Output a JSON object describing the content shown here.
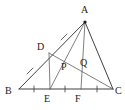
{
  "figure": {
    "kind": "euclidean-geometry-diagram",
    "canvas": {
      "width": 125,
      "height": 110
    },
    "stroke_color": "#2b2b2b",
    "thin_stroke_color": "#555555",
    "background_color": "#ffffff",
    "label_color": "#1c1c1c"
  },
  "points": {
    "A": {
      "label": "A",
      "x": 85,
      "y": 22,
      "label_x": 81,
      "label_y": 5,
      "marked_dot": true
    },
    "B": {
      "label": "B",
      "x": 19,
      "y": 89,
      "label_x": 5,
      "label_y": 86,
      "marked_dot": false
    },
    "C": {
      "label": "C",
      "x": 113,
      "y": 89,
      "label_x": 115,
      "label_y": 86,
      "marked_dot": false
    },
    "D": {
      "label": "D",
      "x": 49,
      "y": 53,
      "label_x": 37,
      "label_y": 42,
      "marked_dot": false
    },
    "E": {
      "label": "E",
      "x": 50,
      "y": 89,
      "label_x": 44,
      "label_y": 94,
      "marked_dot": false
    },
    "F": {
      "label": "F",
      "x": 81,
      "y": 89,
      "label_x": 75,
      "label_y": 94,
      "marked_dot": false
    },
    "P": {
      "label": "P",
      "x": 69,
      "y": 67,
      "label_x": 61,
      "label_y": 62,
      "marked_dot": false
    },
    "Q": {
      "label": "Q",
      "x": 88,
      "y": 64,
      "label_x": 80,
      "label_y": 58,
      "marked_dot": false
    }
  },
  "segments": [
    {
      "name": "segment-BC",
      "from": "B",
      "to": "C",
      "weight": "normal"
    },
    {
      "name": "segment-BA",
      "from": "B",
      "to": "A",
      "weight": "normal"
    },
    {
      "name": "segment-AC",
      "from": "A",
      "to": "C",
      "weight": "normal"
    },
    {
      "name": "segment-AE",
      "from": "A",
      "to": "E",
      "weight": "thin"
    },
    {
      "name": "segment-AF",
      "from": "A",
      "to": "F",
      "weight": "thin"
    },
    {
      "name": "segment-DE",
      "from": "D",
      "to": "E",
      "weight": "thin"
    },
    {
      "name": "segment-DC",
      "from": "D",
      "to": "C",
      "weight": "thin"
    }
  ],
  "tick_marks": [
    {
      "name": "tick-BD",
      "on": "segment-BD",
      "x": 30,
      "y": 71,
      "angle": 35
    },
    {
      "name": "tick-DA",
      "on": "segment-DA",
      "x": 64,
      "y": 37,
      "angle": 35
    },
    {
      "name": "tick-BE",
      "on": "segment-BE",
      "x": 34,
      "y": 89,
      "angle": 0
    },
    {
      "name": "tick-EF",
      "on": "segment-EF",
      "x": 65,
      "y": 89,
      "angle": 0
    },
    {
      "name": "tick-FC",
      "on": "segment-FC",
      "x": 97,
      "y": 89,
      "angle": 0
    }
  ],
  "labels_order": [
    "A",
    "D",
    "P",
    "Q",
    "B",
    "E",
    "F",
    "C"
  ]
}
